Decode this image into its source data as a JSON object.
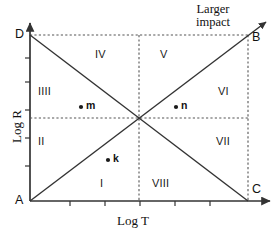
{
  "figure": {
    "axes": {
      "x_label": "Log T",
      "y_label": "Log R"
    },
    "corner_labels": {
      "a": "A",
      "b": "B",
      "c": "C",
      "d": "D"
    },
    "annotation": {
      "line1": "Larger",
      "line2": "impact"
    },
    "regions": [
      {
        "id": "region-1",
        "label": "I"
      },
      {
        "id": "region-2",
        "label": "II"
      },
      {
        "id": "region-3",
        "label": "IIII"
      },
      {
        "id": "region-4",
        "label": "IV"
      },
      {
        "id": "region-5",
        "label": "V"
      },
      {
        "id": "region-6",
        "label": "VI"
      },
      {
        "id": "region-7",
        "label": "VII"
      },
      {
        "id": "region-8",
        "label": "VIII"
      }
    ],
    "points": [
      {
        "id": "point-m",
        "label": "m"
      },
      {
        "id": "point-n",
        "label": "n"
      },
      {
        "id": "point-k",
        "label": "k"
      }
    ],
    "colors": {
      "stroke": "#333333",
      "dashed": "#555555",
      "text": "#111111",
      "background": "#ffffff"
    }
  }
}
